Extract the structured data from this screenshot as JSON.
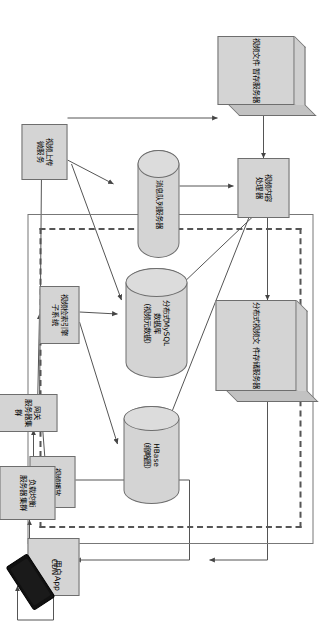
{
  "diagram": {
    "orientation": "landscape-rotated-90cw",
    "colors": {
      "node_fill": "#d4d4d4",
      "node_stroke": "#6e6e6e",
      "edge": "#555555",
      "dashed_zone": "#555555",
      "phone": "#111111",
      "background": "#ffffff"
    },
    "nodes": [
      {
        "id": "video_file_temp_storage",
        "label": "视频文件\n暂存服务器",
        "shape": "cube"
      },
      {
        "id": "video_content_processor",
        "label": "视频内容\n处理器",
        "shape": "rect"
      },
      {
        "id": "distributed_video_file_storage",
        "label": "分布式视频文\n件存储服务器",
        "shape": "cube"
      },
      {
        "id": "message_queue_server",
        "label": "消息队列服务器",
        "shape": "cylinder"
      },
      {
        "id": "distributed_mysql",
        "label": "分布式MySQL\n数据库\n（视频元数据）",
        "shape": "cylinder"
      },
      {
        "id": "hbase",
        "label": "HBase\n（缩略图）",
        "shape": "cylinder"
      },
      {
        "id": "video_upload_microservice",
        "label": "视频上传\n微服务",
        "shape": "rect"
      },
      {
        "id": "video_search_index_subsystem",
        "label": "视频检索引擎\n子系统",
        "shape": "rect"
      },
      {
        "id": "video_playback_microservice",
        "label": "视频播放\n微服务",
        "shape": "rect"
      },
      {
        "id": "gateway_server_cluster",
        "label": "网关\n服务器集群",
        "shape": "rect"
      },
      {
        "id": "load_balancer_cluster",
        "label": "负载均衡\n服务器集群",
        "shape": "rect"
      },
      {
        "id": "cdn",
        "label": "CDN",
        "shape": "rect"
      },
      {
        "id": "user_app",
        "label": "用户App",
        "shape": "phone"
      }
    ],
    "zone_label": ""
  }
}
